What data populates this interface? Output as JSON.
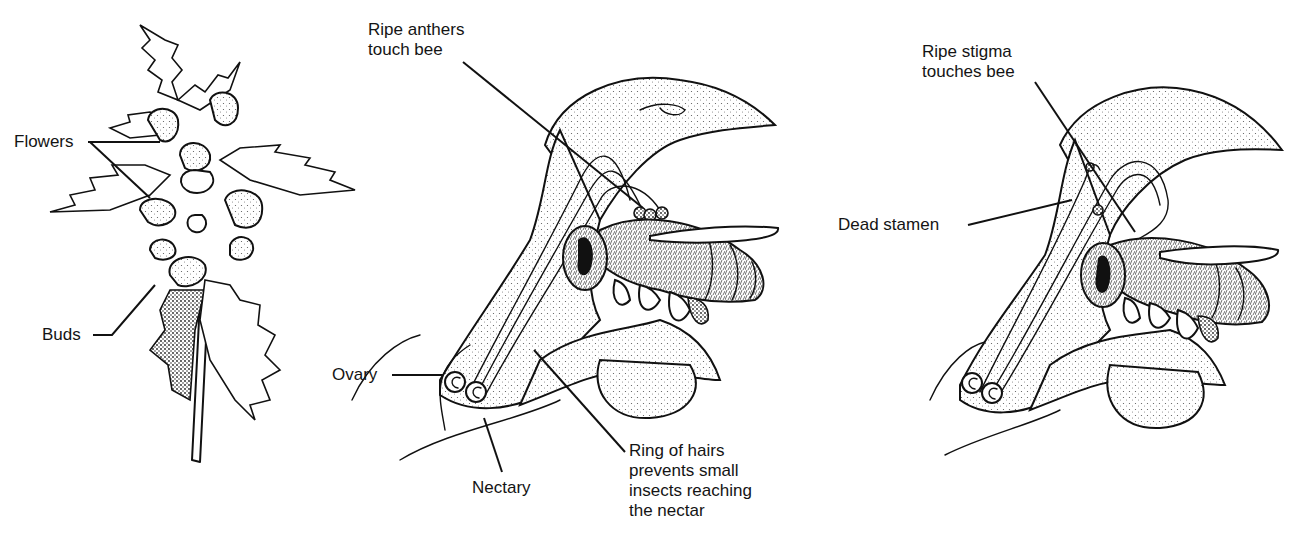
{
  "diagram": {
    "panels": [
      {
        "id": "plant",
        "description": "Flowering stem with leaves, flowers and buds",
        "labels": {
          "flowers": "Flowers",
          "buds": "Buds"
        }
      },
      {
        "id": "young-flower",
        "description": "Section of young flower with bee: anthers ripe",
        "labels": {
          "ripe_anthers": "Ripe anthers\ntouch bee",
          "ovary": "Ovary",
          "nectary": "Nectary",
          "ring_of_hairs": "Ring of hairs\nprevents small\ninsects reaching\nthe nectar"
        }
      },
      {
        "id": "older-flower",
        "description": "Section of older flower with bee: stigma ripe",
        "labels": {
          "ripe_stigma": "Ripe stigma\ntouches bee",
          "dead_stamen": "Dead stamen"
        }
      }
    ],
    "colors": {
      "ink": "#111111",
      "background": "#ffffff"
    }
  }
}
